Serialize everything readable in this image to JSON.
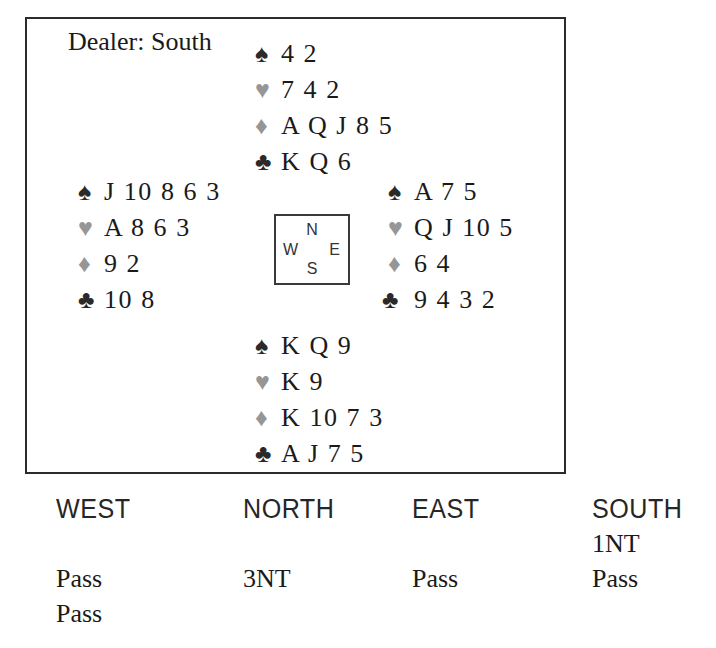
{
  "diagram": {
    "dealer_label": "Dealer: South",
    "compass": {
      "north": "N",
      "south": "S",
      "east": "E",
      "west": "W"
    },
    "suit_symbols": {
      "spade": "♠",
      "heart": "♥",
      "diamond": "♦",
      "club": "♣"
    },
    "suit_colors": {
      "spade": "#2a2a2a",
      "heart": "#969696",
      "diamond": "#969696",
      "club": "#2a2a2a"
    },
    "hands": {
      "north": {
        "spades": "4 2",
        "hearts": "7 4 2",
        "diamonds": "A Q J 8 5",
        "clubs": "K Q 6"
      },
      "west": {
        "spades": "J 10 8 6 3",
        "hearts": "A 8 6 3",
        "diamonds": "9 2",
        "clubs": "10 8"
      },
      "east": {
        "spades": "A 7 5",
        "hearts": "Q J 10 5",
        "diamonds": "6 4",
        "clubs": "9 4 3 2"
      },
      "south": {
        "spades": "K Q 9",
        "hearts": "K 9",
        "diamonds": "K 10 7 3",
        "clubs": "A J 7 5"
      }
    }
  },
  "auction": {
    "headers": {
      "west": "WEST",
      "north": "NORTH",
      "east": "EAST",
      "south": "SOUTH"
    },
    "rows": [
      {
        "west": "",
        "north": "",
        "east": "",
        "south": "1NT"
      },
      {
        "west": "Pass",
        "north": "3NT",
        "east": "Pass",
        "south": "Pass"
      },
      {
        "west": "Pass",
        "north": "",
        "east": "",
        "south": ""
      }
    ]
  }
}
